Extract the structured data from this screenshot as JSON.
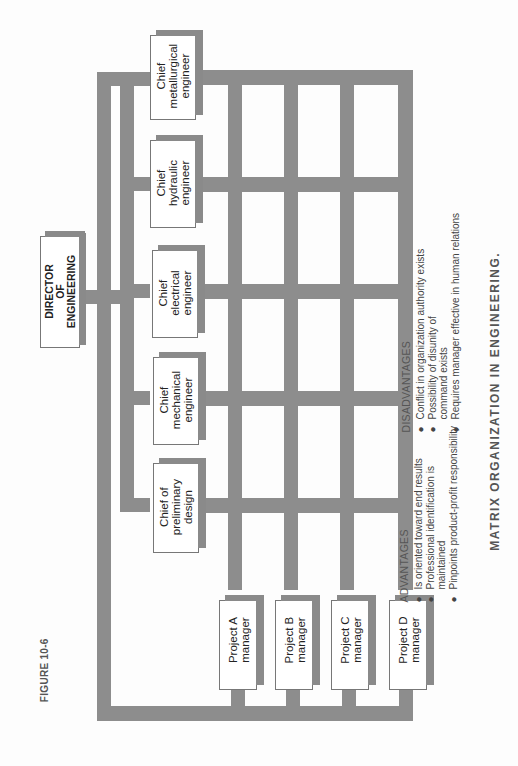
{
  "figure": {
    "label": "FIGURE 10-6",
    "caption": "MATRIX ORGANIZATION IN ENGINEERING.",
    "orientation": "rotated -90 degrees (reads bottom-to-top)"
  },
  "director": {
    "line1": "DIRECTOR",
    "line2": "OF",
    "line3": "ENGINEERING"
  },
  "chiefs": [
    {
      "line1": "Chief",
      "line2": "metallurgical",
      "line3": "engineer"
    },
    {
      "line1": "Chief",
      "line2": "hydraulic",
      "line3": "engineer"
    },
    {
      "line1": "Chief",
      "line2": "electrical",
      "line3": "engineer"
    },
    {
      "line1": "Chief",
      "line2": "mechanical",
      "line3": "engineer"
    },
    {
      "line1": "Chief of",
      "line2": "preliminary",
      "line3": "design"
    }
  ],
  "projects": [
    {
      "line1": "Project A",
      "line2": "manager"
    },
    {
      "line1": "Project B",
      "line2": "manager"
    },
    {
      "line1": "Project C",
      "line2": "manager"
    },
    {
      "line1": "Project D",
      "line2": "manager"
    }
  ],
  "advantages": {
    "heading": "ADVANTAGES",
    "items": [
      "Is oriented toward end results",
      "Professional identification is maintained",
      "Pinpoints product-profit responsibility"
    ]
  },
  "disadvantages": {
    "heading": "DISADVANTAGES",
    "items": [
      "Conflict in organization authority exists",
      "Possibility of disunity of command exists",
      "Requires manager effective in human relations"
    ]
  },
  "colors": {
    "bar": "#8d8d8d",
    "box_border": "#777777",
    "background": "#fdfdfd"
  }
}
